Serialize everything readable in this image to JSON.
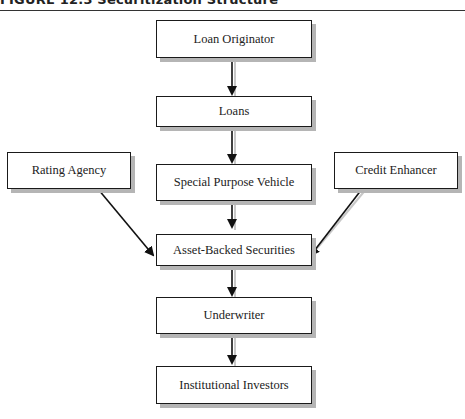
{
  "figure": {
    "title": "FIGURE 12.3  Securitization Structure"
  },
  "nodes": {
    "loan_originator": "Loan Originator",
    "loans": "Loans",
    "special_purpose_vehicle": "Special Purpose Vehicle",
    "rating_agency": "Rating Agency",
    "credit_enhancer": "Credit Enhancer",
    "asset_backed_securities": "Asset-Backed Securities",
    "underwriter": "Underwriter",
    "institutional_investors": "Institutional Investors"
  },
  "edges": [
    {
      "from": "Loan Originator",
      "to": "Loans"
    },
    {
      "from": "Loans",
      "to": "Special Purpose Vehicle"
    },
    {
      "from": "Special Purpose Vehicle",
      "to": "Asset-Backed Securities"
    },
    {
      "from": "Rating Agency",
      "to": "Asset-Backed Securities"
    },
    {
      "from": "Credit Enhancer",
      "to": "Asset-Backed Securities"
    },
    {
      "from": "Asset-Backed Securities",
      "to": "Underwriter"
    },
    {
      "from": "Underwriter",
      "to": "Institutional Investors"
    }
  ]
}
